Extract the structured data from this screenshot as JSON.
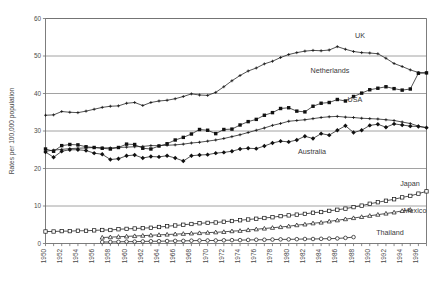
{
  "chart_data": {
    "type": "line",
    "title": "",
    "xlabel": "",
    "ylabel": "Rates per 100,000 population",
    "xlim": [
      1950,
      1997
    ],
    "ylim": [
      0,
      60
    ],
    "yticks": [
      0,
      10,
      20,
      30,
      40,
      50,
      60
    ],
    "grid": "horizontal",
    "legend": "inline-labels",
    "xticks": [
      1950,
      1952,
      1954,
      1956,
      1958,
      1960,
      1962,
      1964,
      1966,
      1968,
      1970,
      1972,
      1974,
      1976,
      1978,
      1980,
      1982,
      1984,
      1986,
      1988,
      1990,
      1992,
      1994,
      1996
    ],
    "xtick_labels": [
      "1950",
      "1952",
      "1954",
      "1956",
      "1958",
      "1960",
      "1962",
      "1964",
      "1966",
      "1968",
      "1970",
      "1972",
      "1974",
      "1976",
      "1978",
      "1980",
      "1982",
      "1984",
      "1986",
      "1988",
      "1990",
      "1992",
      "1994",
      "1996"
    ],
    "x": [
      1950,
      1951,
      1952,
      1953,
      1954,
      1955,
      1956,
      1957,
      1958,
      1959,
      1960,
      1961,
      1962,
      1963,
      1964,
      1965,
      1966,
      1967,
      1968,
      1969,
      1970,
      1971,
      1972,
      1973,
      1974,
      1975,
      1976,
      1977,
      1978,
      1979,
      1980,
      1981,
      1982,
      1983,
      1984,
      1985,
      1986,
      1987,
      1988,
      1989,
      1990,
      1991,
      1992,
      1993,
      1994,
      1995,
      1996,
      1997
    ],
    "series": [
      {
        "name": "UK",
        "marker": "plus",
        "label": "UK",
        "values": [
          34.2,
          34.3,
          35.2,
          35.0,
          34.9,
          35.3,
          35.8,
          36.3,
          36.6,
          36.7,
          37.4,
          37.6,
          36.8,
          37.6,
          38.0,
          38.2,
          38.6,
          39.2,
          39.9,
          39.6,
          39.5,
          40.3,
          41.8,
          43.4,
          44.8,
          46.0,
          46.8,
          47.9,
          48.6,
          49.6,
          50.4,
          50.9,
          51.3,
          51.5,
          51.4,
          51.6,
          52.5,
          51.8,
          51.2,
          50.9,
          50.8,
          50.6,
          49.4,
          48.0,
          47.2,
          46.3,
          45.6,
          45.5
        ]
      },
      {
        "name": "Netherlands",
        "marker": "filled-square",
        "label": "Netherlands",
        "values": [
          25.2,
          24.6,
          26.1,
          26.4,
          26.3,
          25.8,
          25.6,
          25.4,
          25.2,
          25.6,
          26.5,
          26.4,
          25.4,
          25.2,
          26.0,
          26.6,
          27.6,
          28.3,
          29.2,
          30.4,
          30.2,
          29.3,
          30.4,
          30.5,
          31.6,
          32.5,
          33.1,
          34.2,
          34.9,
          36.0,
          36.2,
          35.3,
          35.1,
          36.6,
          37.4,
          37.6,
          38.4,
          38.0,
          39.2,
          40.1,
          41.0,
          41.4,
          41.8,
          41.3,
          40.9,
          41.2,
          45.4,
          45.5
        ]
      },
      {
        "name": "USA",
        "marker": "plus",
        "label": "USA",
        "values": [
          24.6,
          24.9,
          25.1,
          25.3,
          25.4,
          25.5,
          25.6,
          25.5,
          25.5,
          25.6,
          25.7,
          25.8,
          25.9,
          26.1,
          26.1,
          26.2,
          26.3,
          26.5,
          26.8,
          27.0,
          27.3,
          27.6,
          28.0,
          28.5,
          29.0,
          29.6,
          30.2,
          30.8,
          31.5,
          32.0,
          32.6,
          32.8,
          33.0,
          33.3,
          33.6,
          33.8,
          33.9,
          33.7,
          33.6,
          33.4,
          33.3,
          33.2,
          33.0,
          32.8,
          32.4,
          32.0,
          31.3,
          30.9
        ]
      },
      {
        "name": "Australia",
        "marker": "filled-diamond",
        "label": "Australia",
        "values": [
          24.4,
          23.0,
          24.6,
          25.0,
          25.0,
          24.8,
          24.1,
          23.8,
          22.4,
          22.6,
          23.4,
          23.6,
          22.8,
          23.2,
          23.1,
          23.4,
          22.8,
          22.0,
          23.4,
          23.6,
          23.7,
          24.1,
          24.3,
          24.6,
          25.2,
          25.4,
          25.3,
          26.0,
          26.8,
          27.3,
          27.1,
          27.6,
          28.6,
          28.0,
          29.3,
          28.9,
          30.2,
          31.4,
          29.6,
          30.2,
          31.5,
          31.8,
          31.0,
          31.9,
          31.6,
          31.3,
          31.2,
          30.9
        ]
      },
      {
        "name": "Japan",
        "marker": "open-square",
        "label": "Japan",
        "values": [
          3.2,
          3.2,
          3.3,
          3.3,
          3.4,
          3.4,
          3.5,
          3.6,
          3.6,
          3.8,
          3.9,
          4.0,
          4.1,
          4.2,
          4.4,
          4.6,
          4.8,
          5.0,
          5.2,
          5.4,
          5.5,
          5.6,
          5.8,
          6.0,
          6.2,
          6.4,
          6.6,
          6.8,
          7.0,
          7.3,
          7.5,
          7.7,
          7.9,
          8.2,
          8.4,
          8.7,
          9.0,
          9.3,
          9.7,
          10.1,
          10.6,
          11.0,
          11.4,
          11.8,
          12.3,
          12.7,
          13.3,
          13.9
        ]
      },
      {
        "name": "Mexico",
        "marker": "open-triangle",
        "label": "Mexico",
        "values": [
          null,
          null,
          null,
          null,
          null,
          null,
          null,
          1.6,
          1.7,
          1.8,
          1.9,
          2.0,
          2.1,
          2.2,
          2.3,
          2.4,
          2.5,
          2.6,
          2.7,
          2.8,
          2.9,
          3.0,
          3.1,
          3.3,
          3.4,
          3.6,
          3.8,
          4.0,
          4.2,
          4.4,
          4.6,
          4.9,
          5.1,
          5.4,
          5.6,
          5.9,
          6.2,
          6.5,
          6.8,
          7.1,
          7.4,
          7.7,
          8.0,
          8.3,
          8.7,
          9.0,
          null,
          null
        ]
      },
      {
        "name": "Thailand",
        "marker": "open-circle",
        "label": "Thailand",
        "values": [
          null,
          null,
          null,
          null,
          null,
          null,
          null,
          0.4,
          0.4,
          0.45,
          0.5,
          0.5,
          0.55,
          0.6,
          0.6,
          0.65,
          0.7,
          0.7,
          0.75,
          0.8,
          0.8,
          0.8,
          0.85,
          0.9,
          0.9,
          0.95,
          1.0,
          1.0,
          1.05,
          1.1,
          1.1,
          1.15,
          1.2,
          1.2,
          1.25,
          1.3,
          1.35,
          1.5,
          1.7,
          null,
          null,
          null,
          null,
          null,
          null,
          null,
          null,
          null
        ]
      }
    ]
  },
  "labels": {
    "uk": "UK",
    "netherlands": "Netherlands",
    "usa": "USA",
    "australia": "Australia",
    "japan": "Japan",
    "mexico": "Mexico",
    "thailand": "Thailand",
    "ylabel": "Rates per 100,000 population"
  }
}
